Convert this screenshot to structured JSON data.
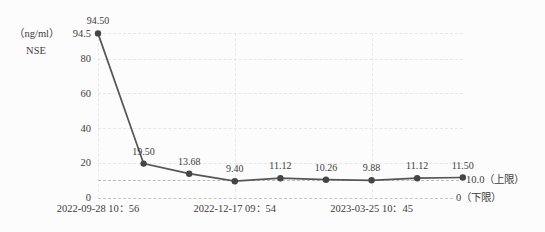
{
  "colors": {
    "background": "#fcfcfc",
    "text": "#3c3c3c",
    "line": "#565656",
    "point": "#454545",
    "gridline": "#e8e8e8",
    "limit_line": "#bdbdbd"
  },
  "chart_data": {
    "type": "line",
    "title": "",
    "unit_label": "（ng/ml）",
    "series_name": "NSE",
    "ylabel": "NSE（ng/ml）",
    "ylim": [
      0,
      94.5
    ],
    "y_ticks": [
      94.5,
      80,
      60,
      40,
      20,
      0
    ],
    "grid": "dashed",
    "legend": "none",
    "points": [
      {
        "label": "94.50",
        "value": 94.5
      },
      {
        "label": "19.50",
        "value": 19.5
      },
      {
        "label": "13.68",
        "value": 13.68
      },
      {
        "label": "9.40",
        "value": 9.4
      },
      {
        "label": "11.12",
        "value": 11.12
      },
      {
        "label": "10.26",
        "value": 10.26
      },
      {
        "label": "9.88",
        "value": 9.88
      },
      {
        "label": "11.12",
        "value": 11.12
      },
      {
        "label": "11.50",
        "value": 11.5
      }
    ],
    "xtick_labels": [
      "2022-09-28  10：56",
      "2022-12-17  09：54",
      "2023-03-25  10：45"
    ],
    "xtick_point_indices": [
      0,
      3,
      6
    ],
    "upper_limit": {
      "value": 10.0,
      "label": "10.0（上限）"
    },
    "lower_limit": {
      "value": 0,
      "label": "0（下限）"
    }
  }
}
